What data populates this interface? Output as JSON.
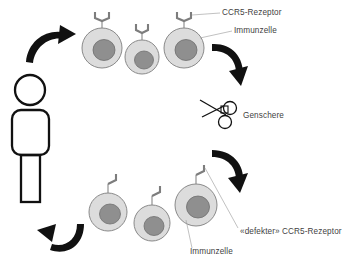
{
  "diagram": {
    "background_color": "#ffffff",
    "labels": {
      "receptor_intact": "CCR5-Rezeptor",
      "immune_cell_top": "Immunzelle",
      "gene_scissors": "Genschere",
      "receptor_defective": "«defekter» CCR5-Rezeptor",
      "immune_cell_bottom": "Immunzelle"
    },
    "colors": {
      "cell_fill": "#dcdcdc",
      "cell_stroke": "#8a8a8a",
      "nucleus_fill": "#8f8f8f",
      "receptor_stroke": "#7d7d7d",
      "arrow_fill": "#111111",
      "text_fill": "#3f3f3f",
      "person_stroke": "#111111"
    },
    "person": {
      "name": "patient-figure",
      "description": "Strichfigur Person"
    },
    "cells_top": [
      {
        "id": "top-cell-1",
        "receptor": "intact",
        "cx": 102,
        "cy": 48,
        "r": 20
      },
      {
        "id": "top-cell-2",
        "receptor": "intact",
        "cx": 142,
        "cy": 57,
        "r": 17
      },
      {
        "id": "top-cell-3",
        "receptor": "intact",
        "cx": 184,
        "cy": 48,
        "r": 20
      }
    ],
    "cells_bottom": [
      {
        "id": "bottom-cell-1",
        "receptor": "defective",
        "cx": 108,
        "cy": 212,
        "r": 19
      },
      {
        "id": "bottom-cell-2",
        "receptor": "defective",
        "cx": 152,
        "cy": 223,
        "r": 18
      },
      {
        "id": "bottom-cell-3",
        "receptor": "defective",
        "cx": 196,
        "cy": 205,
        "r": 21
      }
    ],
    "arrows": [
      {
        "id": "arrow-top-left",
        "direction": "clockwise-up-right"
      },
      {
        "id": "arrow-top-right",
        "direction": "clockwise-down-left"
      },
      {
        "id": "arrow-bottom-right",
        "direction": "clockwise-down-left"
      },
      {
        "id": "arrow-bottom-left",
        "direction": "clockwise-up-left"
      }
    ],
    "scissors": {
      "name": "gene-scissors-icon",
      "label": "Genschere"
    }
  }
}
